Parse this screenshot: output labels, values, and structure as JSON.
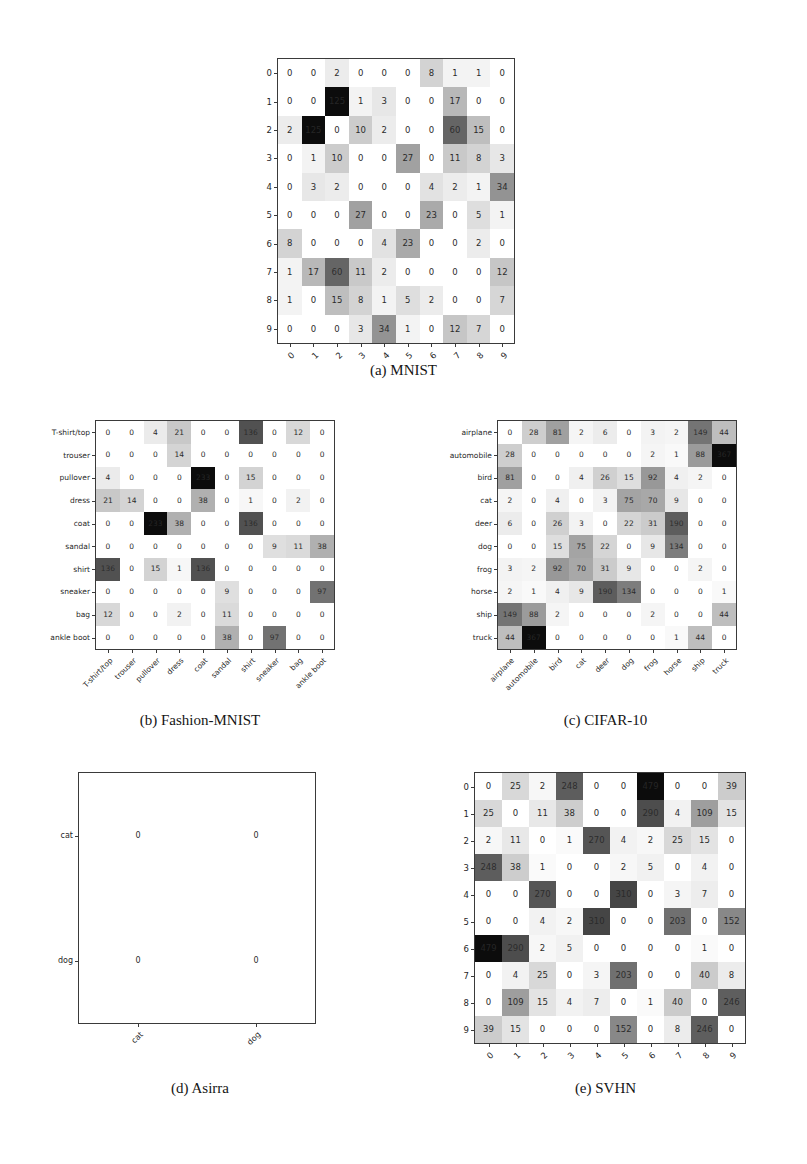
{
  "figure": {
    "kind": "confusion-matrix-grid",
    "panel_count": 5
  },
  "panels": {
    "mnist": {
      "caption": "(a) MNIST",
      "labels": [
        "0",
        "1",
        "2",
        "3",
        "4",
        "5",
        "6",
        "7",
        "8",
        "9"
      ]
    },
    "fashion_mnist": {
      "caption": "(b) Fashion-MNIST",
      "labels": [
        "T-shirt/top",
        "trouser",
        "pullover",
        "dress",
        "coat",
        "sandal",
        "shirt",
        "sneaker",
        "bag",
        "ankle boot"
      ]
    },
    "cifar10": {
      "caption": "(c) CIFAR-10",
      "labels": [
        "airplane",
        "automobile",
        "bird",
        "cat",
        "deer",
        "dog",
        "frog",
        "horse",
        "ship",
        "truck"
      ]
    },
    "asirra": {
      "caption": "(d) Asirra",
      "labels": [
        "cat",
        "dog"
      ]
    },
    "svhn": {
      "caption": "(e) SVHN",
      "labels": [
        "0",
        "1",
        "2",
        "3",
        "4",
        "5",
        "6",
        "7",
        "8",
        "9"
      ]
    }
  },
  "chart_data": [
    {
      "type": "heatmap",
      "id": "mnist",
      "title": "(a) MNIST",
      "xlabel": "",
      "ylabel": "",
      "grid": false,
      "colormap": "greys",
      "vmin": 0,
      "vmax": 125,
      "categories": [
        "0",
        "1",
        "2",
        "3",
        "4",
        "5",
        "6",
        "7",
        "8",
        "9"
      ],
      "x": [
        "0",
        "1",
        "2",
        "3",
        "4",
        "5",
        "6",
        "7",
        "8",
        "9"
      ],
      "y": [
        "0",
        "1",
        "2",
        "3",
        "4",
        "5",
        "6",
        "7",
        "8",
        "9"
      ],
      "values": [
        [
          0,
          0,
          2,
          0,
          0,
          0,
          8,
          1,
          1,
          0
        ],
        [
          0,
          0,
          125,
          1,
          3,
          0,
          0,
          17,
          0,
          0
        ],
        [
          2,
          125,
          0,
          10,
          2,
          0,
          0,
          60,
          15,
          0
        ],
        [
          0,
          1,
          10,
          0,
          0,
          27,
          0,
          11,
          8,
          3
        ],
        [
          0,
          3,
          2,
          0,
          0,
          0,
          4,
          2,
          1,
          34
        ],
        [
          0,
          0,
          0,
          27,
          0,
          0,
          23,
          0,
          5,
          1
        ],
        [
          8,
          0,
          0,
          0,
          4,
          23,
          0,
          0,
          2,
          0
        ],
        [
          1,
          17,
          60,
          11,
          2,
          0,
          0,
          0,
          0,
          12
        ],
        [
          1,
          0,
          15,
          8,
          1,
          5,
          2,
          0,
          0,
          7
        ],
        [
          0,
          0,
          0,
          3,
          34,
          1,
          0,
          12,
          7,
          0
        ]
      ]
    },
    {
      "type": "heatmap",
      "id": "fashion_mnist",
      "title": "(b) Fashion-MNIST",
      "xlabel": "",
      "ylabel": "",
      "grid": false,
      "colormap": "greys",
      "vmin": 0,
      "vmax": 233,
      "categories": [
        "T-shirt/top",
        "trouser",
        "pullover",
        "dress",
        "coat",
        "sandal",
        "shirt",
        "sneaker",
        "bag",
        "ankle boot"
      ],
      "x": [
        "T-shirt/top",
        "trouser",
        "pullover",
        "dress",
        "coat",
        "sandal",
        "shirt",
        "sneaker",
        "bag",
        "ankle boot"
      ],
      "y": [
        "T-shirt/top",
        "trouser",
        "pullover",
        "dress",
        "coat",
        "sandal",
        "shirt",
        "sneaker",
        "bag",
        "ankle boot"
      ],
      "values": [
        [
          0,
          0,
          4,
          21,
          0,
          0,
          136,
          0,
          12,
          0
        ],
        [
          0,
          0,
          0,
          14,
          0,
          0,
          0,
          0,
          0,
          0
        ],
        [
          4,
          0,
          0,
          0,
          233,
          0,
          15,
          0,
          0,
          0
        ],
        [
          21,
          14,
          0,
          0,
          38,
          0,
          1,
          0,
          2,
          0
        ],
        [
          0,
          0,
          233,
          38,
          0,
          0,
          136,
          0,
          0,
          0
        ],
        [
          0,
          0,
          0,
          0,
          0,
          0,
          0,
          9,
          11,
          38
        ],
        [
          136,
          0,
          15,
          1,
          136,
          0,
          0,
          0,
          0,
          0
        ],
        [
          0,
          0,
          0,
          0,
          0,
          9,
          0,
          0,
          0,
          97
        ],
        [
          12,
          0,
          0,
          2,
          0,
          11,
          0,
          0,
          0,
          0
        ],
        [
          0,
          0,
          0,
          0,
          0,
          38,
          0,
          97,
          0,
          0
        ]
      ]
    },
    {
      "type": "heatmap",
      "id": "cifar10",
      "title": "(c) CIFAR-10",
      "xlabel": "",
      "ylabel": "",
      "grid": false,
      "colormap": "greys",
      "vmin": 0,
      "vmax": 367,
      "categories": [
        "airplane",
        "automobile",
        "bird",
        "cat",
        "deer",
        "dog",
        "frog",
        "horse",
        "ship",
        "truck"
      ],
      "x": [
        "airplane",
        "automobile",
        "bird",
        "cat",
        "deer",
        "dog",
        "frog",
        "horse",
        "ship",
        "truck"
      ],
      "y": [
        "airplane",
        "automobile",
        "bird",
        "cat",
        "deer",
        "dog",
        "frog",
        "horse",
        "ship",
        "truck"
      ],
      "values": [
        [
          0,
          28,
          81,
          2,
          6,
          0,
          3,
          2,
          149,
          44
        ],
        [
          28,
          0,
          0,
          0,
          0,
          0,
          2,
          1,
          88,
          367
        ],
        [
          81,
          0,
          0,
          4,
          26,
          15,
          92,
          4,
          2,
          0
        ],
        [
          2,
          0,
          4,
          0,
          3,
          75,
          70,
          9,
          0,
          0
        ],
        [
          6,
          0,
          26,
          3,
          0,
          22,
          31,
          190,
          0,
          0
        ],
        [
          0,
          0,
          15,
          75,
          22,
          0,
          9,
          134,
          0,
          0
        ],
        [
          3,
          2,
          92,
          70,
          31,
          9,
          0,
          0,
          2,
          0
        ],
        [
          2,
          1,
          4,
          9,
          190,
          134,
          0,
          0,
          0,
          1
        ],
        [
          149,
          88,
          2,
          0,
          0,
          0,
          2,
          0,
          0,
          44
        ],
        [
          44,
          367,
          0,
          0,
          0,
          0,
          0,
          1,
          44,
          0
        ]
      ]
    },
    {
      "type": "heatmap",
      "id": "asirra",
      "title": "(d) Asirra",
      "xlabel": "",
      "ylabel": "",
      "grid": false,
      "colormap": "greys",
      "vmin": 0,
      "vmax": 0,
      "categories": [
        "cat",
        "dog"
      ],
      "x": [
        "cat",
        "dog"
      ],
      "y": [
        "cat",
        "dog"
      ],
      "values": [
        [
          0,
          0
        ],
        [
          0,
          0
        ]
      ]
    },
    {
      "type": "heatmap",
      "id": "svhn",
      "title": "(e) SVHN",
      "xlabel": "",
      "ylabel": "",
      "grid": false,
      "colormap": "greys",
      "vmin": 0,
      "vmax": 479,
      "categories": [
        "0",
        "1",
        "2",
        "3",
        "4",
        "5",
        "6",
        "7",
        "8",
        "9"
      ],
      "x": [
        "0",
        "1",
        "2",
        "3",
        "4",
        "5",
        "6",
        "7",
        "8",
        "9"
      ],
      "y": [
        "0",
        "1",
        "2",
        "3",
        "4",
        "5",
        "6",
        "7",
        "8",
        "9"
      ],
      "values": [
        [
          0,
          25,
          2,
          248,
          0,
          0,
          479,
          0,
          0,
          39
        ],
        [
          25,
          0,
          11,
          38,
          0,
          0,
          290,
          4,
          109,
          15
        ],
        [
          2,
          11,
          0,
          1,
          270,
          4,
          2,
          25,
          15,
          0
        ],
        [
          248,
          38,
          1,
          0,
          0,
          2,
          5,
          0,
          4,
          0
        ],
        [
          0,
          0,
          270,
          0,
          0,
          310,
          0,
          3,
          7,
          0
        ],
        [
          0,
          0,
          4,
          2,
          310,
          0,
          0,
          203,
          0,
          152
        ],
        [
          479,
          290,
          2,
          5,
          0,
          0,
          0,
          0,
          1,
          0
        ],
        [
          0,
          4,
          25,
          0,
          3,
          203,
          0,
          0,
          40,
          8
        ],
        [
          0,
          109,
          15,
          4,
          7,
          0,
          1,
          40,
          0,
          246
        ],
        [
          39,
          15,
          0,
          0,
          0,
          152,
          0,
          8,
          246,
          0
        ]
      ]
    }
  ]
}
